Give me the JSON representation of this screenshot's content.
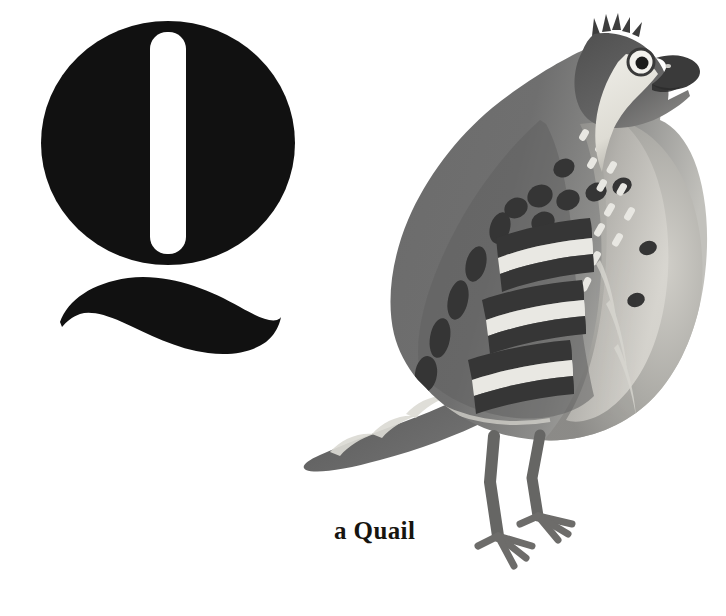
{
  "page": {
    "width": 726,
    "height": 616,
    "background_color": "#ffffff",
    "kind": "alphabet-book-illustration-page"
  },
  "letter": {
    "character": "Q",
    "name": "letter-q",
    "color": "#111111",
    "style": "bold serif display capital with detached swash tail",
    "bowl": {
      "center_x": 168,
      "center_y": 143,
      "radius_x": 127,
      "radius_y": 122
    },
    "counter": {
      "description": "white vertical rounded bar inside bowl",
      "x": 150,
      "y": 32,
      "width": 36,
      "height": 222,
      "color": "#ffffff"
    },
    "tail": {
      "description": "S-curved swash stroke below bowl",
      "x_start": 60,
      "x_end": 281,
      "y_top": 276,
      "y_bottom": 356
    }
  },
  "caption": {
    "text": "a Quail",
    "color": "#17140f",
    "font_size_px": 25,
    "font_weight": "bold",
    "x": 334,
    "y": 515
  },
  "illustration": {
    "subject": "quail",
    "description": "grayscale painted quail standing in profile facing right",
    "palette": {
      "ink_dark": "#2b2b2b",
      "body_mid": "#6e6e6e",
      "body_dark": "#4a4a4a",
      "body_light": "#b9b9b9",
      "breast_pale": "#d6d4cf",
      "highlight": "#efeeea",
      "white": "#ffffff"
    },
    "parts": [
      {
        "name": "crest",
        "label": "spiky crown feathers"
      },
      {
        "name": "eye",
        "label": "dark eye with white eye-ring"
      },
      {
        "name": "beak",
        "label": "short hooked dark beak"
      },
      {
        "name": "throat",
        "label": "pale cream throat patch"
      },
      {
        "name": "nape-spots",
        "label": "light dashes along neck"
      },
      {
        "name": "back-spots",
        "label": "dark oval spots on upper back"
      },
      {
        "name": "wing-bars",
        "label": "dark and light barred wing coverts"
      },
      {
        "name": "flank",
        "label": "pale gray flank"
      },
      {
        "name": "breast",
        "label": "light gray breast"
      },
      {
        "name": "tail",
        "label": "pointed dark tail with pale crescents"
      },
      {
        "name": "legs",
        "label": "two gray legs"
      },
      {
        "name": "feet",
        "label": "three-toed feet"
      }
    ]
  }
}
